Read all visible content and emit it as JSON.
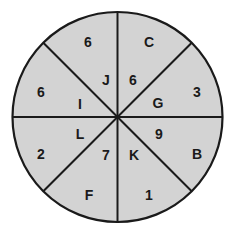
{
  "diagram": {
    "type": "segmented-circle",
    "segments_count": 8,
    "colors": {
      "fill": "#d3d3d3",
      "stroke": "#1a1a1a",
      "text": "#1a1a1a"
    },
    "sectors": [
      {
        "id": "top-left-upper",
        "number": "6",
        "letter": "J"
      },
      {
        "id": "top-right-upper",
        "number": "6",
        "letter": "C"
      },
      {
        "id": "top-right-lower",
        "number": "3",
        "letter": "G"
      },
      {
        "id": "bottom-right-upper",
        "number": "9",
        "letter": "B"
      },
      {
        "id": "bottom-right-lower",
        "number": "1",
        "letter": "K"
      },
      {
        "id": "bottom-left-lower",
        "number": "7",
        "letter": "F"
      },
      {
        "id": "bottom-left-upper",
        "number": "2",
        "letter": "L"
      },
      {
        "id": "top-left-lower",
        "number": "6",
        "letter": "I"
      }
    ],
    "labels": [
      {
        "text": "6",
        "x": 88,
        "y": 42
      },
      {
        "text": "J",
        "x": 106,
        "y": 80
      },
      {
        "text": "6",
        "x": 41,
        "y": 92
      },
      {
        "text": "I",
        "x": 80,
        "y": 104
      },
      {
        "text": "C",
        "x": 149,
        "y": 42
      },
      {
        "text": "6",
        "x": 133,
        "y": 80
      },
      {
        "text": "G",
        "x": 158,
        "y": 103
      },
      {
        "text": "3",
        "x": 197,
        "y": 92
      },
      {
        "text": "L",
        "x": 80,
        "y": 134
      },
      {
        "text": "7",
        "x": 106,
        "y": 155
      },
      {
        "text": "K",
        "x": 134,
        "y": 155
      },
      {
        "text": "9",
        "x": 159,
        "y": 134
      },
      {
        "text": "2",
        "x": 41,
        "y": 154
      },
      {
        "text": "B",
        "x": 197,
        "y": 154
      },
      {
        "text": "F",
        "x": 89,
        "y": 195
      },
      {
        "text": "1",
        "x": 149,
        "y": 195
      }
    ]
  }
}
